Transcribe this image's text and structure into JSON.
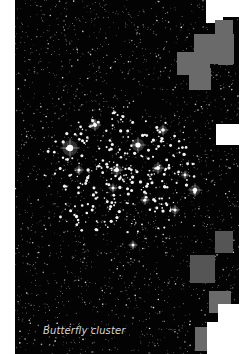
{
  "figure": {
    "caption": "Butterfly cluster",
    "colors": {
      "sky": "#030303",
      "caption_text": "#d8d8d8",
      "mask_gray": "#6a6a6a",
      "mask_white": "#ffffff"
    }
  },
  "mask_blocks": [
    {
      "type": "white",
      "x": 206,
      "y": 0,
      "w": 17,
      "h": 23
    },
    {
      "type": "white",
      "x": 223,
      "y": 0,
      "w": 16,
      "h": 17
    },
    {
      "type": "gray",
      "x": 215,
      "y": 20,
      "w": 18,
      "h": 20
    },
    {
      "type": "gray",
      "x": 194,
      "y": 34,
      "w": 40,
      "h": 30
    },
    {
      "type": "gray",
      "x": 177,
      "y": 52,
      "w": 33,
      "h": 23
    },
    {
      "type": "gray",
      "x": 189,
      "y": 68,
      "w": 22,
      "h": 22
    },
    {
      "type": "gray",
      "x": 218,
      "y": 52,
      "w": 15,
      "h": 13
    },
    {
      "type": "white",
      "x": 216,
      "y": 124,
      "w": 23,
      "h": 21
    },
    {
      "type": "gray-dark",
      "x": 215,
      "y": 231,
      "w": 18,
      "h": 22
    },
    {
      "type": "gray-dark",
      "x": 190,
      "y": 255,
      "w": 25,
      "h": 28
    },
    {
      "type": "gray",
      "x": 209,
      "y": 291,
      "w": 22,
      "h": 22
    },
    {
      "type": "white",
      "x": 218,
      "y": 304,
      "w": 21,
      "h": 50
    },
    {
      "type": "white",
      "x": 207,
      "y": 322,
      "w": 32,
      "h": 32
    },
    {
      "type": "gray",
      "x": 195,
      "y": 327,
      "w": 12,
      "h": 24
    }
  ]
}
